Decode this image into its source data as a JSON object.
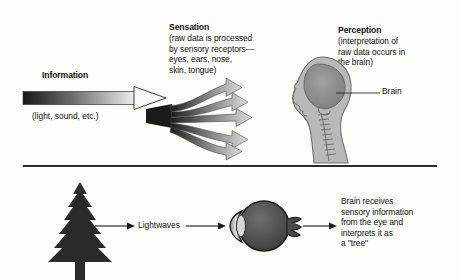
{
  "figure": {
    "title_hidden": "",
    "background_color": "#fdfdfb",
    "divider_color": "#2b2b2b"
  },
  "top_panel": {
    "information": {
      "heading": "Information",
      "subtext": "(light, sound, etc.)",
      "arrow_name": "information-arrow",
      "gradient_from": "#1c1c1c",
      "gradient_to": "#f2f2f2"
    },
    "sensation": {
      "heading": "Sensation",
      "body_lines": [
        "(raw data is processed",
        "by sensory receptors—",
        "eyes, ears, nose,",
        "skin, tongue)"
      ],
      "fan_arrow_count": 5,
      "fan_gradient_from": "#1f1f1f",
      "fan_gradient_to": "#d8d8d8"
    },
    "perception": {
      "heading": "Perception",
      "body_lines": [
        "(interpretation of",
        "raw data occurs in",
        "the brain)"
      ],
      "callout_label": "Brain",
      "head_fill": "#b9b9b9",
      "brain_fill": "#8d8d8d"
    }
  },
  "bottom_panel": {
    "tree": {
      "name": "pine-tree",
      "fill": "#2a2a2a"
    },
    "lightwaves_label": "Lightwaves",
    "eye": {
      "name": "human-eye",
      "sclera_fill": "#585858",
      "cornea_fill": "#c8c8c8"
    },
    "result_lines": [
      "Brain receives",
      "sensory information",
      "from the eye and",
      "interprets it as",
      "a \"tree\""
    ]
  }
}
